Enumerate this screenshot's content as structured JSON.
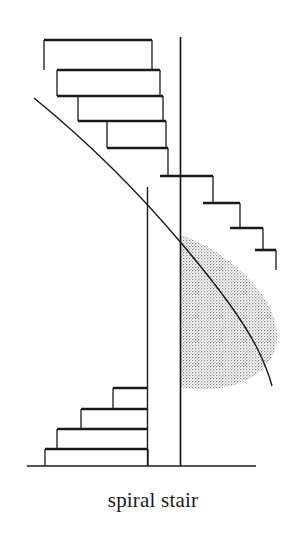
{
  "figure": {
    "caption": "spiral stair",
    "title": "spiral stair",
    "kind": "line-drawing",
    "background_color": "#ffffff",
    "ink_color": "#1a1a1a",
    "stipple_color": "#7a7a7a",
    "canvas": {
      "width": 306,
      "height": 535
    }
  },
  "diagram_data": {
    "type": "technical-line-drawing",
    "subject": "spiral staircase elevation",
    "center_pole": {
      "label": "center pole",
      "x": 180.5,
      "y_top": 37,
      "y_bottom": 466,
      "stroke_width": 1.6
    },
    "secondary_post": {
      "label": "inner post",
      "x": 147.5,
      "y_top": 187,
      "y_bottom": 466,
      "stroke_width": 1.4
    },
    "ground_line": {
      "label": "ground line",
      "x1": 27,
      "x2": 256,
      "y": 466,
      "stroke_width": 1.6
    },
    "helix_curve": {
      "label": "outer helix edge",
      "description": "sweeping curve from upper-left down and around to the right bulge",
      "path": "M 34,98 C 96,150 150,210 198,268 C 232,308 252,344 258,372"
    },
    "shaded_region": {
      "label": "stippled underside of helix",
      "fill": "stipple",
      "bounds": {
        "x_left": 180.5,
        "x_right": 277,
        "y_top": 235,
        "y_bottom": 387
      }
    },
    "treads_upper": [
      {
        "index": 1,
        "tread_y": 40,
        "x_left": 44,
        "x_right": 152,
        "riser_x": 44,
        "riser_to": 70
      },
      {
        "index": 2,
        "tread_y": 70,
        "x_left": 57,
        "x_right": 160,
        "riser_x": 57,
        "riser_to": 95
      },
      {
        "index": 3,
        "tread_y": 95,
        "x_left": 74,
        "x_right": 168,
        "riser_x": 74,
        "riser_to": 120
      },
      {
        "index": 4,
        "tread_y": 120,
        "x_left": 100,
        "x_right": 172,
        "riser_x": 100,
        "riser_to": 148
      },
      {
        "index": 5,
        "tread_y": 148,
        "x_left": 116,
        "x_right": 167,
        "riser_x": 116,
        "riser_to": 175
      },
      {
        "index": 6,
        "tread_y": 175,
        "x_left": 162,
        "x_right": 212,
        "riser_x": 212,
        "riser_to": 202
      },
      {
        "index": 7,
        "tread_y": 202,
        "x_left": 188,
        "x_right": 236,
        "riser_x": 236,
        "riser_to": 228
      },
      {
        "index": 8,
        "tread_y": 228,
        "x_left": 212,
        "x_right": 252,
        "riser_x": 252,
        "riser_to": 250
      },
      {
        "index": 9,
        "tread_y": 250,
        "x_left": 236,
        "x_right": 266,
        "riser_x": 266,
        "riser_to": 268
      }
    ],
    "treads_lower": [
      {
        "index": 10,
        "tread_y": 388,
        "x_left": 113,
        "x_right": 148,
        "riser_x": 113,
        "riser_to": 408
      },
      {
        "index": 11,
        "tread_y": 408,
        "x_left": 81,
        "x_right": 148,
        "riser_x": 81,
        "riser_to": 428
      },
      {
        "index": 12,
        "tread_y": 428,
        "x_left": 56,
        "x_right": 148,
        "riser_x": 56,
        "riser_to": 448
      },
      {
        "index": 13,
        "tread_y": 448,
        "x_left": 44,
        "x_right": 148,
        "riser_x": 44,
        "riser_to": 466
      }
    ]
  }
}
